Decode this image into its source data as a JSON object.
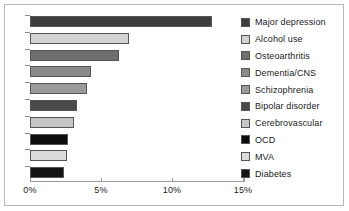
{
  "chart_data": {
    "type": "bar",
    "orientation": "horizontal",
    "title": "",
    "subtitle": "",
    "xlabel": "",
    "ylabel": "",
    "xlim": [
      0,
      15
    ],
    "grid": false,
    "legend_position": "right",
    "x_ticks": [
      {
        "value": 0,
        "label": "0%"
      },
      {
        "value": 5,
        "label": "5%"
      },
      {
        "value": 10,
        "label": "10%"
      },
      {
        "value": 15,
        "label": "15%"
      }
    ],
    "categories": [
      "Major depression",
      "Alcohol use",
      "Osteoarthritis",
      "Dementia/CNS",
      "Schizophrenia",
      "Bipolar disorder",
      "Cerebrovascular",
      "OCD",
      "MVA",
      "Diabetes"
    ],
    "values": [
      12.8,
      7.0,
      6.3,
      4.3,
      4.0,
      3.3,
      3.1,
      2.7,
      2.6,
      2.4
    ],
    "colors": [
      "#3e3e3e",
      "#d2d2d2",
      "#6e6e6e",
      "#8a8a8a",
      "#9a9a9a",
      "#4a4a4a",
      "#c6c6c6",
      "#0d0d0d",
      "#dcdcdc",
      "#141414"
    ],
    "bar_outline_color": "#555555",
    "axis_color": "#9a9a9a",
    "background_color": "#ffffff",
    "frame_color": "#b8b8b8"
  },
  "legend": {
    "items": [
      {
        "label": "Major depression",
        "color": "#3e3e3e"
      },
      {
        "label": "Alcohol use",
        "color": "#d2d2d2"
      },
      {
        "label": "Osteoarthritis",
        "color": "#6e6e6e"
      },
      {
        "label": "Dementia/CNS",
        "color": "#8a8a8a"
      },
      {
        "label": "Schizophrenia",
        "color": "#9a9a9a"
      },
      {
        "label": "Bipolar disorder",
        "color": "#4a4a4a"
      },
      {
        "label": "Cerebrovascular",
        "color": "#c6c6c6"
      },
      {
        "label": "OCD",
        "color": "#0d0d0d"
      },
      {
        "label": "MVA",
        "color": "#dcdcdc"
      },
      {
        "label": "Diabetes",
        "color": "#141414"
      }
    ]
  }
}
